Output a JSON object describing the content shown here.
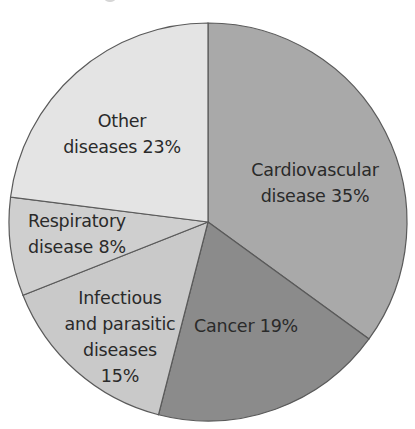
{
  "chart_data": {
    "type": "pie",
    "title": "",
    "start_angle_deg": 0,
    "direction": "clockwise",
    "categories": [
      "Cardiovascular disease",
      "Cancer",
      "Infectious and parasitic diseases",
      "Respiratory disease",
      "Other diseases"
    ],
    "values": [
      35,
      19,
      15,
      8,
      23
    ],
    "unit": "%",
    "colors": [
      "#a9a9a9",
      "#8b8b8b",
      "#c9c9c9",
      "#cfcfcf",
      "#e4e4e4"
    ],
    "labels": [
      {
        "lines": [
          "Cardiovascular",
          "disease 35%"
        ],
        "x": 315,
        "y": 183
      },
      {
        "lines": [
          "Cancer 19%"
        ],
        "x": 246,
        "y": 326
      },
      {
        "lines": [
          "Infectious",
          "and parasitic",
          "diseases",
          "15%"
        ],
        "x": 120,
        "y": 337
      },
      {
        "lines": [
          "Respiratory",
          "disease 8%"
        ],
        "x": 77,
        "y": 234
      },
      {
        "lines": [
          "Other",
          "diseases 23%"
        ],
        "x": 122,
        "y": 134
      }
    ],
    "legend": "none"
  },
  "geometry": {
    "cx": 208,
    "cy": 222,
    "r": 199
  }
}
